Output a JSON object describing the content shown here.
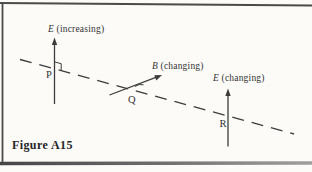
{
  "figure": {
    "caption": "Figure A15",
    "field_labels": {
      "p": {
        "symbol": "E",
        "state": "(increasing)"
      },
      "q": {
        "symbol": "B",
        "state": "(changing)"
      },
      "r": {
        "symbol": "E",
        "state": "(changing)"
      }
    },
    "points": {
      "p": "P",
      "q": "Q",
      "r": "R"
    },
    "colors": {
      "ink": "#3c3c3c",
      "paper": "#fcfbf8",
      "frame": "#4b4b4b"
    }
  }
}
